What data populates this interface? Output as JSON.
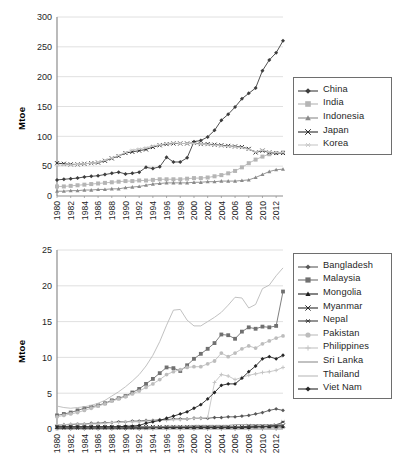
{
  "figure": {
    "kind": "two stacked line charts",
    "y_axis_title": "Mtoe"
  },
  "chart_data": [
    {
      "type": "line",
      "title": "",
      "xlabel": "",
      "ylabel": "Mtoe",
      "ylim": [
        0,
        300
      ],
      "yticks": [
        0,
        50,
        100,
        150,
        200,
        250,
        300
      ],
      "grid": true,
      "legend_position": "right",
      "x": [
        1980,
        1981,
        1982,
        1983,
        1984,
        1985,
        1986,
        1987,
        1988,
        1989,
        1990,
        1991,
        1992,
        1993,
        1994,
        1995,
        1996,
        1997,
        1998,
        1999,
        2000,
        2001,
        2002,
        2003,
        2004,
        2005,
        2006,
        2007,
        2008,
        2009,
        2010,
        2011,
        2012,
        2013
      ],
      "xticks": [
        1980,
        1982,
        1984,
        1986,
        1988,
        1990,
        1992,
        1994,
        1996,
        1998,
        2000,
        2002,
        2004,
        2006,
        2008,
        2010,
        2012
      ],
      "series": [
        {
          "name": "China",
          "marker": "diamond",
          "color": "#3d3d3d",
          "values": [
            27,
            28,
            29,
            30,
            32,
            33,
            34,
            36,
            38,
            40,
            37,
            38,
            40,
            48,
            46,
            49,
            65,
            57,
            57,
            64,
            91,
            93,
            99,
            110,
            127,
            137,
            149,
            163,
            172,
            181,
            210,
            228,
            240,
            260
          ]
        },
        {
          "name": "India",
          "marker": "square",
          "color": "#b5b5b5",
          "values": [
            16,
            16,
            17,
            18,
            19,
            20,
            21,
            22,
            23,
            24,
            25,
            25,
            26,
            26,
            27,
            28,
            28,
            28,
            28,
            29,
            30,
            30,
            31,
            33,
            35,
            38,
            42,
            48,
            55,
            61,
            66,
            70,
            72,
            73
          ]
        },
        {
          "name": "Indonesia",
          "marker": "triangle",
          "color": "#8a8a8a",
          "values": [
            8,
            8,
            9,
            9,
            10,
            10,
            11,
            11,
            12,
            12,
            14,
            15,
            16,
            18,
            20,
            21,
            22,
            22,
            22,
            22,
            23,
            23,
            24,
            24,
            25,
            25,
            25,
            26,
            27,
            31,
            36,
            41,
            44,
            45
          ]
        },
        {
          "name": "Japan",
          "marker": "x",
          "color": "#2b2b2b",
          "values": [
            55,
            54,
            53,
            53,
            54,
            55,
            56,
            59,
            63,
            67,
            72,
            74,
            76,
            78,
            82,
            85,
            87,
            88,
            88,
            88,
            89,
            87,
            87,
            86,
            85,
            84,
            83,
            82,
            79,
            73,
            76,
            73,
            72,
            72
          ]
        },
        {
          "name": "Korea",
          "marker": "asterisk",
          "color": "#c9c9c9",
          "values": [
            52,
            52,
            52,
            53,
            54,
            55,
            57,
            60,
            64,
            68,
            73,
            77,
            79,
            81,
            84,
            86,
            88,
            89,
            88,
            88,
            88,
            87,
            86,
            85,
            84,
            83,
            82,
            81,
            78,
            74,
            77,
            74,
            73,
            73
          ]
        }
      ]
    },
    {
      "type": "line",
      "title": "",
      "xlabel": "",
      "ylabel": "Mtoe",
      "ylim": [
        0,
        25
      ],
      "yticks": [
        0,
        5,
        10,
        15,
        20,
        25
      ],
      "grid": true,
      "legend_position": "right",
      "x": [
        1980,
        1981,
        1982,
        1983,
        1984,
        1985,
        1986,
        1987,
        1988,
        1989,
        1990,
        1991,
        1992,
        1993,
        1994,
        1995,
        1996,
        1997,
        1998,
        1999,
        2000,
        2001,
        2002,
        2003,
        2004,
        2005,
        2006,
        2007,
        2008,
        2009,
        2010,
        2011,
        2012,
        2013
      ],
      "xticks": [
        1980,
        1982,
        1984,
        1986,
        1988,
        1990,
        1992,
        1994,
        1996,
        1998,
        2000,
        2002,
        2004,
        2006,
        2008,
        2010,
        2012
      ],
      "series": [
        {
          "name": "Bangladesh",
          "marker": "diamond",
          "color": "#595959",
          "values": [
            0.5,
            0.6,
            0.6,
            0.7,
            0.7,
            0.8,
            0.8,
            0.9,
            0.9,
            1.0,
            1.0,
            1.1,
            1.1,
            1.2,
            1.2,
            1.3,
            1.3,
            1.4,
            1.4,
            1.4,
            1.5,
            1.5,
            1.5,
            1.6,
            1.6,
            1.7,
            1.7,
            1.8,
            1.9,
            2.1,
            2.3,
            2.6,
            2.8,
            2.6
          ]
        },
        {
          "name": "Malaysia",
          "marker": "square",
          "color": "#707070",
          "values": [
            1.9,
            2.1,
            2.3,
            2.6,
            2.9,
            3.1,
            3.3,
            3.6,
            4.0,
            4.3,
            4.6,
            5.1,
            5.6,
            6.3,
            7.0,
            7.8,
            8.6,
            8.5,
            8.1,
            8.9,
            9.8,
            10.5,
            11.2,
            12.0,
            13.2,
            13.1,
            12.6,
            13.6,
            14.2,
            14.0,
            14.3,
            14.2,
            14.4,
            19.2
          ]
        },
        {
          "name": "Mongolia",
          "marker": "triangle",
          "color": "#1f1f1f",
          "values": [
            0.2,
            0.2,
            0.2,
            0.2,
            0.2,
            0.2,
            0.2,
            0.2,
            0.2,
            0.2,
            0.2,
            0.2,
            0.2,
            0.2,
            0.2,
            0.2,
            0.2,
            0.2,
            0.2,
            0.2,
            0.2,
            0.2,
            0.2,
            0.2,
            0.2,
            0.2,
            0.2,
            0.2,
            0.2,
            0.3,
            0.3,
            0.3,
            0.3,
            0.3
          ]
        },
        {
          "name": "Myanmar",
          "marker": "x",
          "color": "#2b2b2b",
          "values": [
            0.3,
            0.3,
            0.3,
            0.3,
            0.3,
            0.3,
            0.3,
            0.3,
            0.3,
            0.3,
            0.3,
            0.3,
            0.3,
            0.3,
            0.3,
            0.3,
            0.3,
            0.3,
            0.3,
            0.3,
            0.3,
            0.3,
            0.3,
            0.3,
            0.3,
            0.3,
            0.3,
            0.3,
            0.4,
            0.4,
            0.4,
            0.4,
            0.5,
            0.5
          ]
        },
        {
          "name": "Nepal",
          "marker": "asterisk",
          "color": "#3d3d3d",
          "values": [
            0.1,
            0.1,
            0.1,
            0.1,
            0.1,
            0.1,
            0.1,
            0.1,
            0.1,
            0.1,
            0.1,
            0.1,
            0.1,
            0.1,
            0.2,
            0.2,
            0.2,
            0.2,
            0.2,
            0.2,
            0.2,
            0.2,
            0.2,
            0.2,
            0.2,
            0.2,
            0.2,
            0.2,
            0.3,
            0.3,
            0.3,
            0.4,
            0.5,
            1.0
          ]
        },
        {
          "name": "Pakistan",
          "marker": "circle",
          "color": "#bdbdbd",
          "values": [
            1.7,
            1.9,
            2.1,
            2.3,
            2.6,
            2.9,
            3.2,
            3.5,
            3.9,
            4.2,
            4.5,
            4.9,
            5.3,
            5.8,
            6.3,
            6.9,
            7.6,
            8.0,
            8.3,
            8.6,
            8.7,
            8.7,
            9.1,
            9.5,
            10.6,
            10.1,
            10.6,
            11.2,
            11.6,
            11.3,
            11.9,
            12.3,
            12.7,
            13.0
          ]
        },
        {
          "name": "Philippines",
          "marker": "plus",
          "color": "#c4c4c4",
          "values": [
            0.6,
            0.6,
            0.7,
            0.7,
            0.7,
            0.7,
            0.7,
            0.8,
            0.9,
            0.9,
            1.0,
            1.0,
            1.0,
            1.1,
            1.1,
            1.2,
            1.2,
            1.3,
            1.3,
            1.4,
            1.5,
            1.5,
            1.6,
            6.5,
            7.6,
            7.4,
            6.9,
            7.2,
            7.5,
            7.7,
            7.9,
            8.0,
            8.2,
            8.6
          ]
        },
        {
          "name": "Sri Lanka",
          "marker": "line",
          "color": "#8f8f8f",
          "values": [
            0.2,
            0.2,
            0.2,
            0.2,
            0.2,
            0.2,
            0.2,
            0.2,
            0.2,
            0.2,
            0.3,
            0.3,
            0.3,
            0.3,
            0.3,
            0.3,
            0.4,
            0.4,
            0.4,
            0.4,
            0.5,
            0.5,
            0.5,
            0.5,
            0.5,
            0.5,
            0.6,
            0.6,
            0.6,
            0.6,
            0.6,
            0.6,
            0.6,
            0.6
          ]
        },
        {
          "name": "Thailand",
          "marker": "line",
          "color": "#bababa",
          "values": [
            3.2,
            3.0,
            2.9,
            3.0,
            3.1,
            3.3,
            3.6,
            4.0,
            4.6,
            5.2,
            5.9,
            6.7,
            7.6,
            8.8,
            10.3,
            12.2,
            14.5,
            16.6,
            16.7,
            15.2,
            14.4,
            14.4,
            15.0,
            15.6,
            16.3,
            17.3,
            18.4,
            18.3,
            16.9,
            17.4,
            19.6,
            20.1,
            21.4,
            22.5
          ]
        },
        {
          "name": "Viet Nam",
          "marker": "diamond",
          "color": "#262626",
          "values": [
            0.3,
            0.3,
            0.3,
            0.3,
            0.3,
            0.3,
            0.3,
            0.3,
            0.3,
            0.3,
            0.4,
            0.4,
            0.5,
            0.8,
            1.0,
            1.2,
            1.5,
            1.8,
            2.1,
            2.4,
            2.9,
            3.4,
            4.2,
            5.1,
            6.1,
            6.3,
            6.3,
            7.1,
            8.0,
            8.8,
            9.8,
            10.1,
            9.8,
            10.3
          ]
        }
      ]
    }
  ]
}
